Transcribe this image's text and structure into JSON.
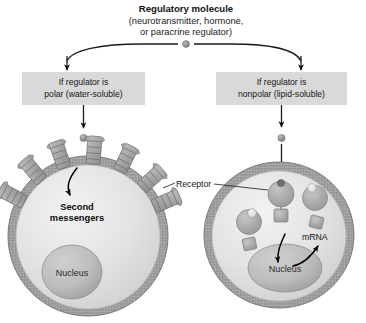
{
  "figure": {
    "title": "Regulatory molecule",
    "subtitle_line1": "(neurotransmitter, hormone,",
    "subtitle_line2": "or paracrine regulator)"
  },
  "branches": {
    "left": {
      "box_line1": "If regulator is",
      "box_line2": "polar (water-soluble)",
      "cell_label": "Second",
      "cell_label_line2": "messengers",
      "nucleus_label": "Nucleus"
    },
    "right": {
      "box_line1": "If regulator is",
      "box_line2": "nonpolar (lipid-soluble)",
      "mrna_label": "mRNA",
      "nucleus_label": "Nucleus"
    }
  },
  "shared": {
    "receptor_label": "Receptor"
  },
  "colors": {
    "box_fill": "#d9d9d9",
    "cytoplasm": "#e2e2e2",
    "membrane": "#9a9a9a",
    "nucleus": "#b3b3b3",
    "receptor": "#9e9e9e",
    "ligand": "#8a8a8a",
    "stroke": "#1a1a1a",
    "background": "#ffffff"
  }
}
